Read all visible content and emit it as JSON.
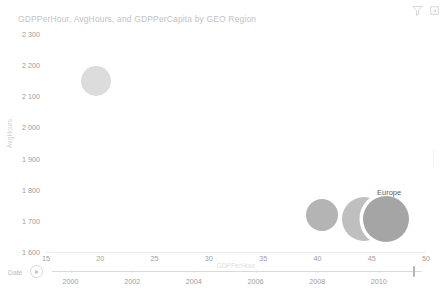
{
  "header": {
    "icons": [
      {
        "name": "filter-icon",
        "label": "Filter"
      },
      {
        "name": "focus-mode-icon",
        "label": "Focus mode"
      }
    ]
  },
  "chart_data": {
    "type": "scatter",
    "title": "GDPPerHour, AvgHours, and GDPPerCapita by GEO Region",
    "xlabel": "GDPPerHour",
    "ylabel": "AvgHours",
    "xlim": [
      15,
      50
    ],
    "ylim": [
      1600,
      2300
    ],
    "xticks": [
      "15",
      "20",
      "25",
      "30",
      "35",
      "40",
      "45",
      "50"
    ],
    "xtick_values": [
      15,
      20,
      25,
      30,
      35,
      40,
      45,
      50
    ],
    "yticks": [
      "2 300",
      "2 200",
      "2 100",
      "2 000",
      "1 900",
      "1 800",
      "1 700",
      "1 600"
    ],
    "ytick_values": [
      2300,
      2200,
      2100,
      2000,
      1900,
      1800,
      1700,
      1600
    ],
    "grid": false,
    "legend": "none",
    "size_encoding": "GDPPerCapita",
    "points": [
      {
        "label": "",
        "x": 19.6,
        "y": 2150,
        "size": 30,
        "color": "#dcdcdc",
        "show_label": false,
        "halo": false
      },
      {
        "label": "",
        "x": 40.4,
        "y": 1718,
        "size": 32,
        "color": "#b4b4b4",
        "show_label": false,
        "halo": false
      },
      {
        "label": "",
        "x": 44.3,
        "y": 1705,
        "size": 44,
        "color": "#bfbfbf",
        "show_label": false,
        "halo": false
      },
      {
        "label": "Europe",
        "x": 46.3,
        "y": 1706,
        "size": 46,
        "color": "#a5a5a5",
        "show_label": true,
        "halo": true,
        "label_x": 46.6,
        "label_y": 1793
      }
    ]
  },
  "timeline": {
    "label": "Date",
    "play_button_label": "Play",
    "years": [
      "2000",
      "2002",
      "2004",
      "2006",
      "2008",
      "2010"
    ],
    "year_values": [
      2000,
      2002,
      2004,
      2006,
      2008,
      2010
    ],
    "range": [
      1999.4,
      2011.4
    ],
    "handle_value": 2011.1
  }
}
